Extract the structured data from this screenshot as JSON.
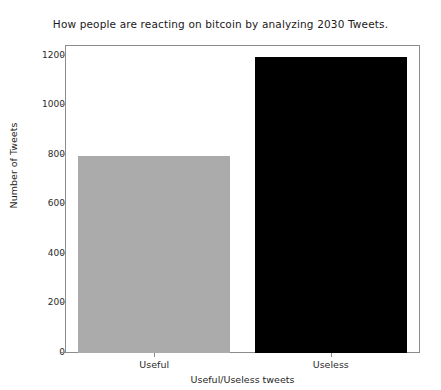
{
  "chart_data": {
    "type": "bar",
    "title": "How people are reacting on bitcoin by analyzing 2030 Tweets.",
    "xlabel": "Useful/Useless tweets",
    "ylabel": "Number of Tweets",
    "categories": [
      "Useful",
      "Useless"
    ],
    "values": [
      795,
      1196
    ],
    "bar_colors": [
      "#ababab",
      "#000000"
    ],
    "ylim": [
      0,
      1240
    ],
    "yticks": [
      0,
      200,
      400,
      600,
      800,
      1000,
      1200
    ],
    "ytick_labels": [
      "0",
      "200",
      "400",
      "600",
      "800",
      "1000",
      "1200"
    ],
    "grid": false,
    "legend": "none",
    "series": [
      {
        "name": "Tweets",
        "values": [
          795,
          1196
        ]
      }
    ]
  }
}
